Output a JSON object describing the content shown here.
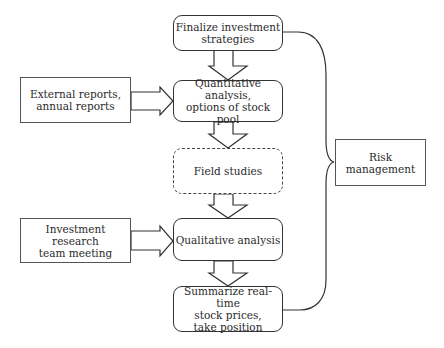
{
  "diagram": {
    "main_flow": [
      {
        "id": "finalize",
        "label": "Finalize investment\nstrategies",
        "style": "rounded"
      },
      {
        "id": "quantitative",
        "label": "Quantitative analysis,\noptions of stock pool",
        "style": "rounded"
      },
      {
        "id": "field",
        "label": "Field studies",
        "style": "dashed"
      },
      {
        "id": "qualitative",
        "label": "Qualitative analysis",
        "style": "rounded"
      },
      {
        "id": "summarize",
        "label": "Summarize real-time\nstock prices,\ntake position",
        "style": "rounded"
      }
    ],
    "inputs": [
      {
        "id": "external",
        "label": "External reports,\nannual reports",
        "target": "quantitative"
      },
      {
        "id": "meeting",
        "label": "Investment research\nteam meeting",
        "target": "qualitative"
      }
    ],
    "side": {
      "id": "risk",
      "label": "Risk\nmanagement",
      "connects": [
        "finalize",
        "summarize"
      ]
    }
  }
}
